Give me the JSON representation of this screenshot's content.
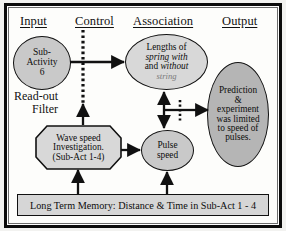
{
  "diagram": {
    "title_columns": [
      {
        "label": "Input"
      },
      {
        "label": "Control"
      },
      {
        "label": "Association"
      },
      {
        "label": "Output"
      }
    ],
    "nodes": {
      "sub_activity": {
        "line1": "Sub-",
        "line2": "Activity",
        "line3": "6",
        "shape": "ellipse",
        "fill": "#c9c9c9"
      },
      "readout_filter": {
        "line1": "Read-out",
        "line2": "Filter"
      },
      "lengths": {
        "line1": "Lengths of",
        "line2": "spring with",
        "line3a": "and ",
        "line3b": "without",
        "line4": "string",
        "shape": "ellipse",
        "fill": "#d8d8d8"
      },
      "wave_speed": {
        "line1": "Wave speed",
        "line2": "Investigation.",
        "line3": "(Sub-Act 1-4)",
        "shape": "octagon",
        "fill": "#d8d8d8"
      },
      "pulse_speed": {
        "line1": "Pulse",
        "line2": "speed",
        "shape": "ellipse",
        "fill": "#c9c9c9"
      },
      "prediction": {
        "line1": "Prediction",
        "line2": "&",
        "line3": "experiment",
        "line4": "was limited",
        "line5": "to speed of",
        "line6": "pulses.",
        "shape": "ellipse",
        "fill": "#b5b5b5"
      },
      "long_term_memory": {
        "text": "Long Term Memory:  Distance & Time in Sub-Act 1 - 4",
        "shape": "rectangle",
        "fill": "#d6d6d6"
      }
    },
    "colors": {
      "stroke": "#111111",
      "frame": "#0b0b0b",
      "page_bg": "#f2f2f0",
      "canvas_bg": "#fdfdfb"
    }
  }
}
